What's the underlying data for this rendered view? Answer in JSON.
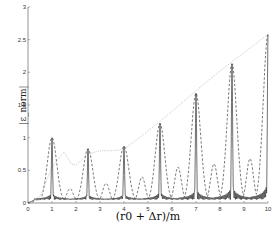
{
  "chart_data": {
    "type": "line",
    "title": "",
    "xlabel": "(r0 + Δr)/m",
    "ylabel": "|ε_norm|",
    "xlim": [
      0,
      10
    ],
    "ylim": [
      0,
      3
    ],
    "grid": false,
    "legend": "none",
    "x_ticks": [
      "0",
      "1",
      "2",
      "3",
      "4",
      "5",
      "6",
      "7",
      "8",
      "9",
      "10"
    ],
    "y_ticks": [
      "0",
      "0.5",
      "1",
      "1.5",
      "2",
      "2.5",
      "3"
    ],
    "peak_positions": [
      1.0,
      2.5,
      4.0,
      5.5,
      7.0,
      8.5,
      10.0
    ],
    "series": [
      {
        "name": "solid",
        "style": "solid",
        "color": "#333333",
        "peaks": [
          1.0,
          0.83,
          0.87,
          1.22,
          1.68,
          2.13,
          2.58
        ],
        "baseline": 0.05
      },
      {
        "name": "dashed",
        "style": "dashed",
        "color": "#555555",
        "peaks": [
          1.0,
          0.83,
          0.87,
          1.22,
          1.68,
          2.13,
          2.58
        ],
        "secondary_bumps": [
          {
            "x": 0.4,
            "y": 0.05
          },
          {
            "x": 1.75,
            "y": 0.22
          },
          {
            "x": 3.25,
            "y": 0.3
          },
          {
            "x": 4.75,
            "y": 0.4
          },
          {
            "x": 6.25,
            "y": 0.55
          },
          {
            "x": 7.75,
            "y": 0.6
          },
          {
            "x": 9.25,
            "y": 0.68
          }
        ]
      },
      {
        "name": "dotted",
        "style": "dotted",
        "color": "#b8b8b8",
        "x": [
          0,
          0.5,
          1.0,
          1.5,
          1.8,
          2.0,
          2.5,
          3.0,
          3.5,
          4.0,
          5.0,
          6.0,
          7.0,
          8.0,
          9.0,
          10.0
        ],
        "values": [
          0,
          0.1,
          0.55,
          0.78,
          0.6,
          0.58,
          0.75,
          0.8,
          0.8,
          0.82,
          1.1,
          1.4,
          1.72,
          2.02,
          2.3,
          2.58
        ]
      }
    ]
  }
}
